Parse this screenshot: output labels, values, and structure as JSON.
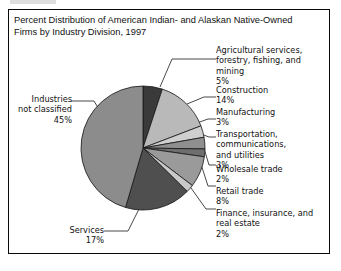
{
  "figure": {
    "title": "Percent Distribution of American Indian- and Alaskan Native-Owned\nFirms by Industry Division, 1997",
    "border_color": "#0a0a0a",
    "background": "#ffffff"
  },
  "chart_data": {
    "type": "pie",
    "title": "Percent Distribution of American Indian- and Alaskan Native-Owned Firms by Industry Division, 1997",
    "xlabel": "",
    "ylabel": "",
    "units": "percent",
    "start_angle_deg": 0,
    "direction": "clockwise",
    "legend": "callout-labels",
    "grid": false,
    "categories": [
      "Agricultural services, forestry, fishing, and mining",
      "Construction",
      "Manufacturing",
      "Transportation, communications, and utilities",
      "Wholesale trade",
      "Retail trade",
      "Finance, insurance, and real estate",
      "Services",
      "Industries not classified"
    ],
    "values": [
      5,
      14,
      3,
      3,
      2,
      8,
      2,
      17,
      45
    ],
    "colors": [
      "#3a3a3a",
      "#b9b9b9",
      "#cfcfcf",
      "#8f8f8f",
      "#6e6e6e",
      "#9a9a9a",
      "#c9c9c9",
      "#4f4f4f",
      "#8c8c8c"
    ],
    "slices": [
      {
        "label": "Agricultural services, forestry, fishing, and mining",
        "value": 5,
        "display": "5%",
        "color": "#3a3a3a"
      },
      {
        "label": "Construction",
        "value": 14,
        "display": "14%",
        "color": "#b9b9b9"
      },
      {
        "label": "Manufacturing",
        "value": 3,
        "display": "3%",
        "color": "#cfcfcf"
      },
      {
        "label": "Transportation, communications, and utilities",
        "value": 3,
        "display": "3%",
        "color": "#8f8f8f"
      },
      {
        "label": "Wholesale trade",
        "value": 2,
        "display": "2%",
        "color": "#6e6e6e"
      },
      {
        "label": "Retail trade",
        "value": 8,
        "display": "8%",
        "color": "#9a9a9a"
      },
      {
        "label": "Finance, insurance, and real estate",
        "value": 2,
        "display": "2%",
        "color": "#c9c9c9"
      },
      {
        "label": "Services",
        "value": 17,
        "display": "17%",
        "color": "#4f4f4f"
      },
      {
        "label": "Industries not classified",
        "value": 45,
        "display": "45%",
        "color": "#8c8c8c"
      }
    ]
  },
  "callouts": {
    "agricultural": "Agricultural services,\nforestry, fishing, and\nmining\n5%",
    "construction": "Construction\n14%",
    "manufacturing": "Manufacturing\n3%",
    "transportation": "Transportation,\ncommunications,\nand utilities\n3%",
    "wholesale": "Wholesale trade\n2%",
    "retail": "Retail trade\n8%",
    "finance": "Finance, insurance, and\nreal estate\n2%",
    "services": "Services\n17%",
    "industries": "Industries\nnot classified\n45%"
  }
}
